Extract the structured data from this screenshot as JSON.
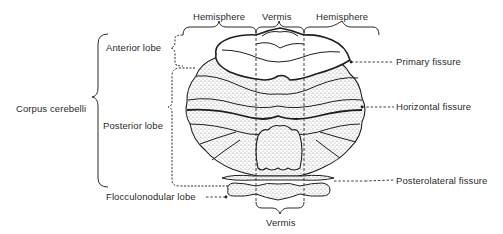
{
  "diagram": {
    "type": "anatomical",
    "top_labels": {
      "left_hemisphere": "Hemisphere",
      "vermis": "Vermis",
      "right_hemisphere": "Hemisphere"
    },
    "left_labels": {
      "corpus": "Corpus cerebelli",
      "anterior": "Anterior lobe",
      "posterior": "Posterior lobe",
      "flocculonodular": "Flocculonodular lobe"
    },
    "right_labels": {
      "primary": "Primary fissure",
      "horizontal": "Horizontal fissure",
      "posterolateral": "Posterolateral fissure"
    },
    "bottom_labels": {
      "vermis": "Vermis"
    },
    "colors": {
      "line": "#1e1e1e",
      "stipple": "#9a9a9a",
      "background": "#ffffff"
    }
  }
}
